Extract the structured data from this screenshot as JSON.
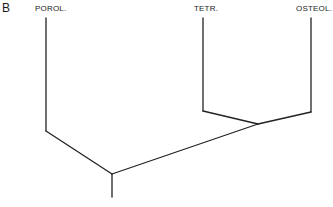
{
  "panel_label": "B",
  "taxa": [
    {
      "name": "POROL.",
      "x": 35
    },
    {
      "name": "TETR.",
      "x": 194
    },
    {
      "name": "OSTEOL.",
      "x": 296
    }
  ],
  "tree": {
    "type": "cladogram",
    "topology": "(POROL., (TETR., OSTEOL.))",
    "line_color": "#222222"
  }
}
